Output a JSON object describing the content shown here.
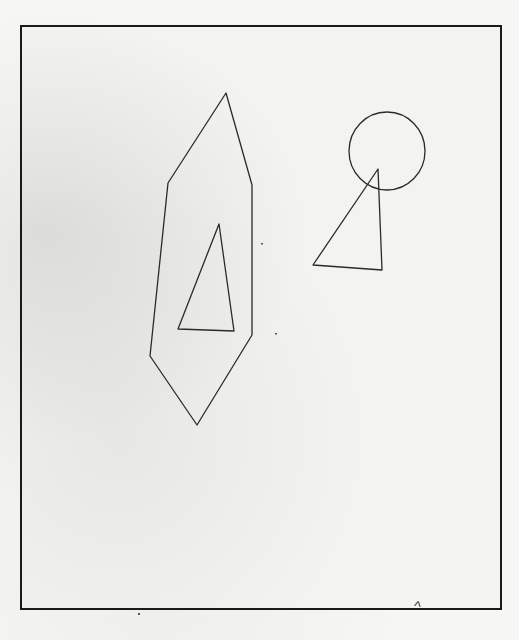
{
  "scan": {
    "description": "Hand-drawn sketch inside a rectangular frame",
    "frame_color": "#1a1a1a",
    "stroke_color": "#2a2a2a",
    "paper_color": "#f3f3f1"
  },
  "shapes": [
    {
      "name": "tall-hexagon",
      "type": "polygon",
      "points": "226,93 252,185 252,335 197,425 150,356 168,183"
    },
    {
      "name": "inner-triangle",
      "type": "polygon",
      "points": "219,224 178,329 234,331"
    },
    {
      "name": "circle",
      "type": "ellipse",
      "cx": 387,
      "cy": 151,
      "rx": 38,
      "ry": 39
    },
    {
      "name": "right-triangle",
      "type": "polygon",
      "points": "378,169 313,265 382,270"
    }
  ],
  "annotation": {
    "mark": "^"
  }
}
